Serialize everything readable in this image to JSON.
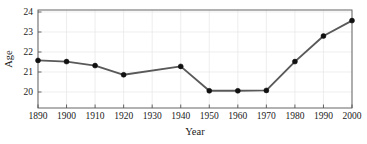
{
  "figure": {
    "background_color": "#ffffff",
    "plot_area": {
      "left": 38,
      "right": 352,
      "top": 10,
      "bottom": 108
    }
  },
  "chart_data": {
    "type": "line",
    "title": "",
    "subtitle": "",
    "xlabel": "Year",
    "ylabel": "Age",
    "x": [
      1890,
      1900,
      1910,
      1920,
      1930,
      1940,
      1950,
      1960,
      1970,
      1980,
      1990,
      2000
    ],
    "values": [
      21.58,
      21.52,
      21.32,
      20.86,
      null,
      21.28,
      20.06,
      20.06,
      20.08,
      21.52,
      22.8,
      23.57
    ],
    "markers_shown_at": [
      1890,
      1900,
      1910,
      1920,
      1940,
      1950,
      1960,
      1970,
      1980,
      1990,
      2000
    ],
    "categories": [
      "1890",
      "1900",
      "1910",
      "1920",
      "1930",
      "1940",
      "1950",
      "1960",
      "1970",
      "1980",
      "1990",
      "2000"
    ],
    "xticks": [
      1890,
      1900,
      1910,
      1920,
      1930,
      1940,
      1950,
      1960,
      1970,
      1980,
      1990,
      2000
    ],
    "xticklabels": [
      "1890",
      "1900",
      "1910",
      "1920",
      "1930",
      "1940",
      "1950",
      "1960",
      "1970",
      "1980",
      "1990",
      "2000"
    ],
    "yticks": [
      20,
      21,
      22,
      23,
      24
    ],
    "yticklabels": [
      "20",
      "21",
      "22",
      "23",
      "24"
    ],
    "xlim": [
      1890,
      2000
    ],
    "ylim": [
      19.2,
      24.1
    ],
    "grid": true,
    "grid_axis": "both",
    "legend": false,
    "legend_position": "none",
    "line_color": "#595959",
    "marker_color": "#111111",
    "marker_style": "circle",
    "grid_color": "#e6e6e6",
    "axis_color": "#555555",
    "text_color": "#1a1a1a"
  }
}
